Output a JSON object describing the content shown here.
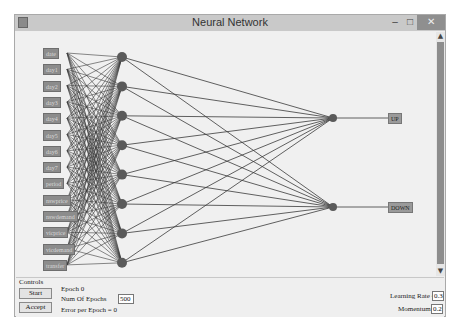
{
  "window": {
    "title": "Neural Network",
    "buttons": {
      "minimize": "–",
      "maximize": "□",
      "close": "✕"
    }
  },
  "network": {
    "inputs": [
      "date",
      "day1",
      "day2",
      "day3",
      "day4",
      "day5",
      "day6",
      "day7",
      "period",
      "nswprice",
      "nswdemand",
      "vicprice",
      "vicdemand",
      "transfer"
    ],
    "hidden_count": 8,
    "outputs": [
      "UP",
      "DOWN"
    ],
    "colors": {
      "node": "#5a5a5a",
      "edge": "#3a3a3a",
      "label_bg": "#8c8c8c"
    }
  },
  "scrollbar": {
    "up": "▲",
    "down": "▼"
  },
  "controls": {
    "title": "Controls",
    "start_label": "Start",
    "accept_label": "Accept",
    "epoch_label": "Epoch",
    "epoch_value": "0",
    "num_epochs_label": "Num Of Epochs",
    "num_epochs_value": "500",
    "error_label": "Error per Epoch = 0",
    "learning_rate_label": "Learning Rate =",
    "learning_rate_value": "0.3",
    "momentum_label": "Momentum =",
    "momentum_value": "0.2"
  }
}
